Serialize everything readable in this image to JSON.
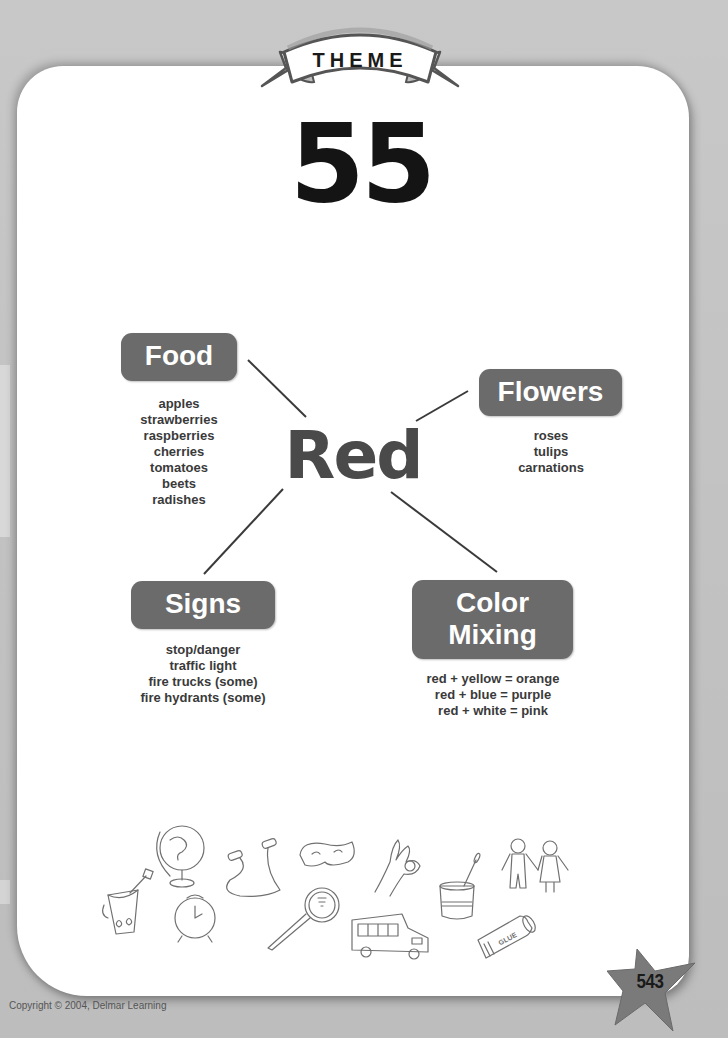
{
  "theme": {
    "banner_label": "THEME",
    "number": "55"
  },
  "web": {
    "center_word": "Red",
    "center_color": "#4a4a4a",
    "box_color": "#6b6b6b",
    "categories": [
      {
        "title_lines": [
          "Food"
        ],
        "items": [
          "apples",
          "strawberries",
          "raspberries",
          "cherries",
          "tomatoes",
          "beets",
          "radishes"
        ]
      },
      {
        "title_lines": [
          "Flowers"
        ],
        "items": [
          "roses",
          "tulips",
          "carnations"
        ]
      },
      {
        "title_lines": [
          "Signs"
        ],
        "items": [
          "stop/danger",
          "traffic light",
          "fire trucks (some)",
          "fire hydrants (some)"
        ]
      },
      {
        "title_lines": [
          "Color",
          "Mixing"
        ],
        "items": [
          "red + yellow = orange",
          "red + blue = purple",
          "red + white = pink"
        ]
      }
    ]
  },
  "clipart": {
    "icons": [
      "sand-bucket-icon",
      "globe-icon",
      "alarm-clock-icon",
      "jump-rope-icon",
      "magnifying-glass-icon",
      "cat-mask-icon",
      "ok-hand-sign-icon",
      "school-bus-icon",
      "paint-cup-icon",
      "paper-doll-children-icon",
      "glue-stick-icon"
    ],
    "glue_label": "GLUE"
  },
  "footer": {
    "copyright": "Copyright © 2004, Delmar Learning",
    "page_number": "543"
  }
}
